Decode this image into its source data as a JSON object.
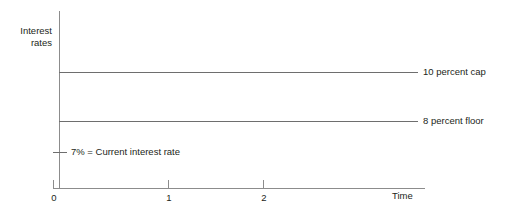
{
  "chart_data": {
    "type": "line",
    "title": "",
    "xlabel": "Time",
    "ylabel": "Interest rates",
    "ylabel_line1": "Interest",
    "ylabel_line2": "rates",
    "x": [
      0,
      1,
      2
    ],
    "xtick_labels": [
      "0",
      "1",
      "2"
    ],
    "xlim": [
      0,
      3.2
    ],
    "ylim": [
      0,
      12
    ],
    "grid": false,
    "legend_position": "right-of-line-ends",
    "series": [
      {
        "name": "10 percent cap",
        "label": "10 percent cap",
        "value": 10,
        "values": [
          10,
          10,
          10
        ],
        "style": "horizontal-line",
        "color": "#6e6e6e"
      },
      {
        "name": "8 percent floor",
        "label": "8 percent floor",
        "value": 8,
        "values": [
          8,
          8,
          8
        ],
        "style": "horizontal-line",
        "color": "#6e6e6e"
      }
    ],
    "annotations": [
      {
        "name": "current-rate",
        "text": "7% = Current interest rate",
        "value": 7,
        "marker": "y-axis-tick"
      }
    ],
    "axis_color": "#8c8c8c"
  },
  "colors": {
    "background": "#ffffff",
    "text": "#231f20",
    "axis": "#8c8c8c",
    "line": "#6e6e6e"
  }
}
